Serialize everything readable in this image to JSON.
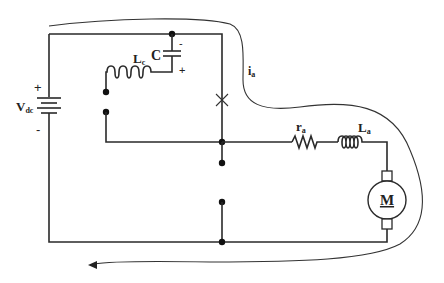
{
  "diagram": {
    "type": "circuit",
    "title": "",
    "source": {
      "label": "V",
      "subscript": "dc",
      "plus": "+",
      "minus": "-"
    },
    "capacitor": {
      "label": "C",
      "plus": "+",
      "minus": "-"
    },
    "commutation_inductor": {
      "label": "L",
      "subscript": "c"
    },
    "armature_resistor": {
      "label": "r",
      "subscript": "a"
    },
    "armature_inductor": {
      "label": "L",
      "subscript": "a"
    },
    "motor": {
      "label": "M"
    },
    "current": {
      "label": "i",
      "subscript": "a"
    },
    "colors": {
      "line": "#2a2a2a",
      "background": "#ffffff"
    }
  }
}
